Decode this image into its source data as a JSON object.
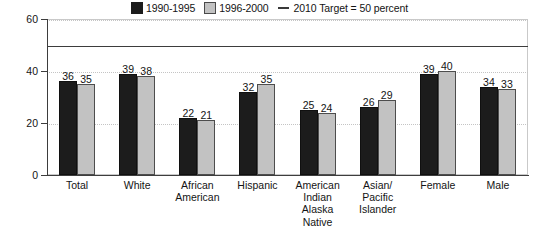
{
  "chart_data": {
    "type": "bar",
    "title": "",
    "subtitle": "",
    "xlabel": "",
    "ylabel": "Percent",
    "ylim": [
      0,
      60
    ],
    "yticks": [
      0,
      20,
      40,
      60
    ],
    "grid": true,
    "legend_position": "top-center",
    "categories": [
      "Total",
      "African American",
      "White",
      "Hispanic",
      "American Indian Alaska Native",
      "Asian/ Pacific Islander",
      "Female",
      "Male"
    ],
    "category_lines": [
      [
        "Total"
      ],
      [
        "White"
      ],
      [
        "African",
        "American"
      ],
      [
        "Hispanic"
      ],
      [
        "American",
        "Indian",
        "Alaska",
        "Native"
      ],
      [
        "Asian/",
        "Pacific",
        "Islander"
      ],
      [
        "Female"
      ],
      [
        "Male"
      ]
    ],
    "series": [
      {
        "name": "1990-1995",
        "color": "#1c1c1c",
        "values": [
          36,
          39,
          22,
          32,
          25,
          26,
          39,
          34
        ]
      },
      {
        "name": "1996-2000",
        "color": "#c2c2c2",
        "values": [
          35,
          38,
          21,
          35,
          24,
          29,
          40,
          33
        ]
      }
    ],
    "reference_line": {
      "label": "2010 Target = 50 percent",
      "value": 50,
      "color": "#3d3d3d"
    }
  },
  "legend": {
    "items": [
      {
        "label": "1990-1995",
        "marker": "swatch-dark"
      },
      {
        "label": "1996-2000",
        "marker": "swatch-light"
      },
      {
        "label": "2010 Target = 50 percent",
        "marker": "line-dark"
      }
    ]
  },
  "axis": {
    "y_title": "Percent",
    "y_tick_labels": [
      "60",
      "40",
      "20",
      "0"
    ]
  }
}
